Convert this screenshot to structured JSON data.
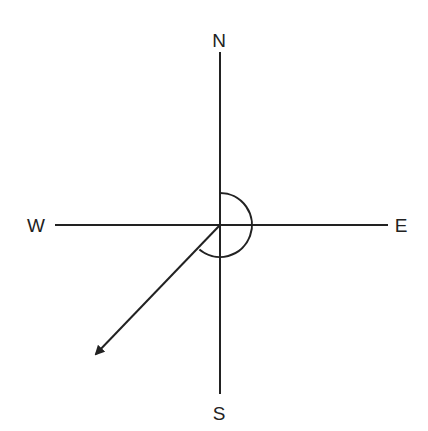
{
  "diagram": {
    "type": "compass-bearing",
    "labels": {
      "north": "N",
      "south": "S",
      "east": "E",
      "west": "W"
    },
    "center": [
      220,
      225
    ],
    "arc": {
      "from": "north",
      "direction": "clockwise",
      "to_bearing_deg": 220,
      "radius": 32
    },
    "arrow": {
      "bearing": "south-west",
      "tip": [
        93,
        358
      ]
    },
    "colors": {
      "stroke": "#222222",
      "background": "#ffffff"
    }
  }
}
